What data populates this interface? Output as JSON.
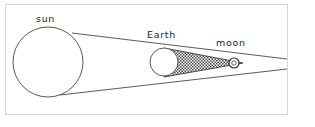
{
  "figure": {
    "type": "astronomy-diagram",
    "frame": {
      "border_color": "#d8d8d8",
      "background_color": "#ffffff"
    }
  },
  "labels": {
    "sun": "sun",
    "earth": "Earth",
    "moon": "moon"
  },
  "bodies": {
    "sun": {
      "name": "sun",
      "cx": 48,
      "cy": 62,
      "r": 35,
      "fill": "#ffffff",
      "stroke": "#5a5a5a"
    },
    "earth": {
      "name": "Earth",
      "cx": 164,
      "cy": 62,
      "r": 14,
      "fill": "#ffffff",
      "stroke": "#5a5a5a"
    },
    "moon": {
      "name": "moon",
      "cx": 234,
      "cy": 63,
      "r": 5,
      "fill": "#ffffff",
      "stroke": "#2f2f2f"
    }
  },
  "shadow": {
    "name": "umbra-cone",
    "pattern": "stipple-dots",
    "pattern_color": "#4a4a4a",
    "apex_x": 243,
    "apex_y": 63
  },
  "rays": {
    "upper_ray": {
      "from_x": 72,
      "from_y": 33,
      "to_x": 287,
      "to_y": 59
    },
    "lower_ray": {
      "from_x": 60,
      "from_y": 95,
      "to_x": 287,
      "to_y": 69
    }
  }
}
